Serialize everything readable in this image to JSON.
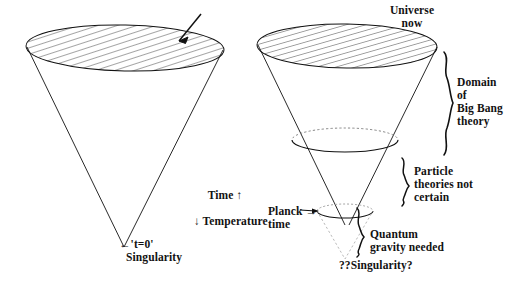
{
  "figure": {
    "background_color": "#ffffff",
    "ink_color": "#111111",
    "faint_ink_color": "#9a9a9a"
  },
  "labels": {
    "universe_now": "Universe\nnow",
    "time_arrow": "Time ↑",
    "temperature_arrow": "↓ Temperature",
    "t_zero": "←'t=0'",
    "singularity": "Singularity",
    "domain_big_bang": "Domain\nof\nBig Bang\ntheory",
    "particle_theories": "Particle\ntheories not\ncertain",
    "planck_time": "Planck →\ntime",
    "quantum_gravity": "Quantum\ngravity needed",
    "question_singularity": "??Singularity?"
  },
  "left_cone": {
    "name": "classical-big-bang-cone",
    "top_ellipse_label": "universe-now-disc",
    "apex_label": "singularity-apex"
  },
  "right_cone": {
    "name": "quantum-era-cone",
    "top_ellipse_label": "universe-now-disc",
    "mid_ellipse_label": "particle-theory-boundary",
    "planck_ellipse_label": "planck-time-boundary",
    "apex_label": "question-singularity-apex"
  },
  "braces": [
    {
      "name": "brace-domain-big-bang",
      "label_key": "domain_big_bang"
    },
    {
      "name": "brace-particle-theories",
      "label_key": "particle_theories"
    },
    {
      "name": "brace-quantum-gravity",
      "label_key": "quantum_gravity"
    }
  ],
  "colors": {
    "stroke": "#111111",
    "hatch": "#1a1a1a",
    "dotted": "#777777",
    "faint": "#a8a8a8"
  }
}
